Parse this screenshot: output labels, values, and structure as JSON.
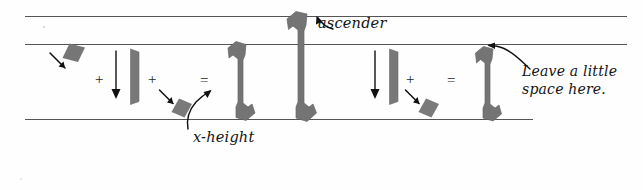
{
  "figure": {
    "background_color": "#fefefe",
    "ink_color": "#6e6e6e",
    "line_color": "#555555",
    "text_color": "#141414"
  },
  "guides": [
    {
      "name": "ascender-line",
      "y": 16,
      "x1": 25,
      "x2": 627
    },
    {
      "name": "x-height-line",
      "y": 44,
      "x1": 25,
      "x2": 627
    },
    {
      "name": "baseline",
      "y": 119,
      "x1": 25,
      "x2": 533
    }
  ],
  "annotations": {
    "ascender": "ascender",
    "x_height": "x-height",
    "leave_space_line1": "Leave a little",
    "leave_space_line2": "space here."
  },
  "operators": {
    "plus_1": "+",
    "plus_2": "+",
    "equals_1": "=",
    "plus_3": "+",
    "equals_2": "="
  },
  "equation_left": {
    "terms": [
      {
        "name": "nib-mark-diamond",
        "kind": "diamond"
      },
      {
        "name": "downstroke-stem",
        "kind": "stem"
      },
      {
        "name": "nib-mark-diamond-exit",
        "kind": "diamond"
      }
    ],
    "result": {
      "name": "letter-l-xheight",
      "kind": "letter"
    }
  },
  "equation_right": {
    "terms": [
      {
        "name": "downstroke-stem",
        "kind": "stem"
      },
      {
        "name": "nib-mark-diamond-exit",
        "kind": "diamond"
      }
    ],
    "result": {
      "name": "letter-l-short",
      "kind": "letter"
    }
  },
  "ascender_letter": {
    "name": "letter-l-ascender",
    "kind": "letter-tall"
  }
}
